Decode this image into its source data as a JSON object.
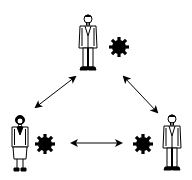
{
  "diagram": {
    "type": "triangle-relationship",
    "background": "#ffffff",
    "stroke_color": "#000000",
    "nodes": [
      {
        "id": "top",
        "figure": "man",
        "icon": "gear-icon",
        "position": "top-center"
      },
      {
        "id": "left",
        "figure": "woman",
        "icon": "gear-icon",
        "position": "bottom-left"
      },
      {
        "id": "right",
        "figure": "man",
        "icon": "gear-icon",
        "position": "bottom-right"
      }
    ],
    "edges": [
      {
        "from": "top",
        "to": "left",
        "style": "double-arrow"
      },
      {
        "from": "top",
        "to": "right",
        "style": "double-arrow"
      },
      {
        "from": "left",
        "to": "right",
        "style": "double-arrow"
      }
    ]
  }
}
